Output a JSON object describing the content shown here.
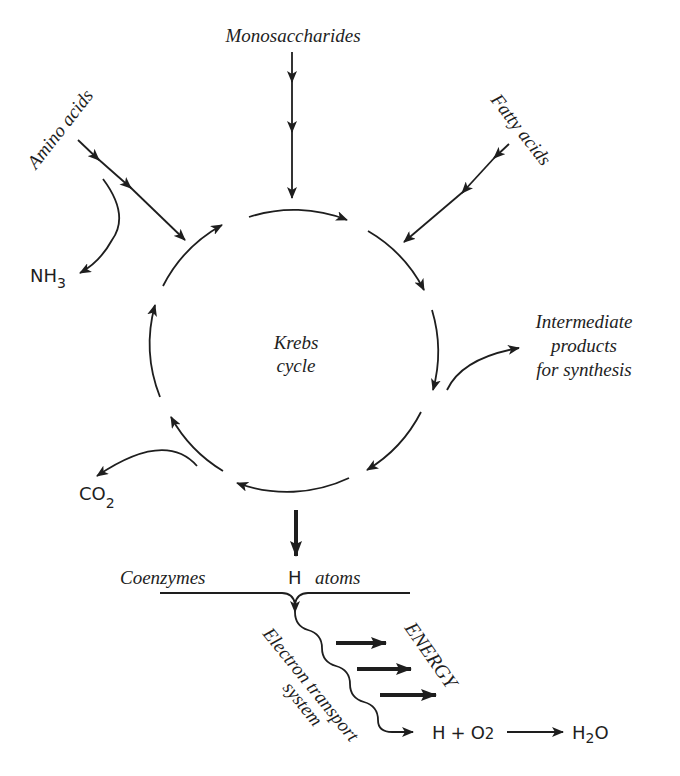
{
  "diagram": {
    "center_label": [
      "Krebs",
      "cycle"
    ],
    "inputs": {
      "monosaccharides": "Monosaccharides",
      "amino_acids": "Amino acids",
      "fatty_acids": "Fatty acids"
    },
    "outputs": {
      "ammonia": {
        "main": "NH",
        "sub": "3"
      },
      "carbon_dioxide": {
        "main": "CO",
        "sub": "2"
      },
      "intermediate": [
        "Intermediate",
        "products",
        "for synthesis"
      ]
    },
    "lower": {
      "coenzymes": "Coenzymes",
      "h_atoms_h": "H",
      "h_atoms_word": "atoms",
      "electron_transport": [
        "Electron transport",
        "system"
      ],
      "energy": "ENERGY",
      "reaction_left": {
        "h": "H",
        "plus": "+",
        "o": "O",
        "o_sub": "2"
      },
      "reaction_right": {
        "h": "H",
        "h_sub": "2",
        "o": "O"
      }
    },
    "colors": {
      "ink": "#1e1e1e",
      "background": "#ffffff"
    }
  }
}
